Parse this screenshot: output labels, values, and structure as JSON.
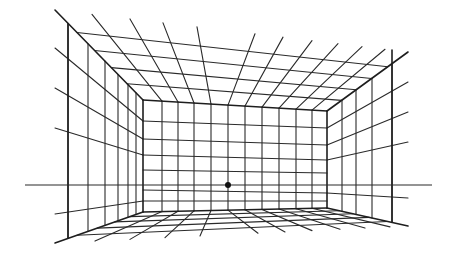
{
  "diagram": {
    "type": "one-point-perspective",
    "colors": {
      "line": "#2a2a2a",
      "background": "#ffffff",
      "vanishing_point": "#111111"
    },
    "vanishing_point": {
      "x": 228,
      "y": 185,
      "radius": 3
    },
    "horizon_line": {
      "x1": 25,
      "x2": 432,
      "y": 185
    },
    "back_wall": {
      "left": 143,
      "right": 327,
      "top_left_y": 100,
      "top_right_y": 111,
      "bottom_left_y": 212,
      "bottom_right_y": 208,
      "vertical_xs": [
        162,
        178,
        194,
        211,
        228,
        245,
        262,
        279,
        296,
        312
      ],
      "horizontal_left_ys": [
        121,
        139,
        155,
        170,
        190,
        201
      ],
      "horizontal_right_ys": [
        128,
        145,
        160,
        173,
        193,
        201
      ]
    },
    "outer_frame": {
      "top_left": [
        55,
        10
      ],
      "top_right": [
        408,
        52
      ],
      "bottom_left": [
        55,
        243
      ],
      "bottom_right": [
        408,
        226
      ]
    },
    "left_wall": {
      "vertical_xs": [
        68,
        88,
        105,
        118,
        128,
        136
      ],
      "horizontal_outer_ys": [
        48,
        88,
        128,
        214
      ],
      "horizontal_inner_ys": [
        121,
        139,
        155,
        201
      ]
    },
    "right_wall": {
      "vertical_xs": [
        342,
        356,
        372,
        392
      ],
      "horizontal_outer_ys": [
        82,
        112,
        142,
        198
      ],
      "horizontal_inner_ys": [
        128,
        145,
        160,
        193
      ]
    },
    "ceiling": {
      "back_xs": [
        162,
        178,
        194,
        211,
        228,
        245,
        262,
        279,
        296,
        312
      ],
      "front_xs": [
        92,
        130,
        163,
        197,
        255,
        283,
        312,
        338,
        362,
        385
      ]
    },
    "floor": {
      "back_xs": [
        162,
        178,
        194,
        211,
        228,
        245,
        262,
        279,
        296,
        312
      ],
      "front_xs": [
        95,
        130,
        165,
        200,
        258,
        285,
        312,
        340,
        365,
        390
      ]
    }
  }
}
